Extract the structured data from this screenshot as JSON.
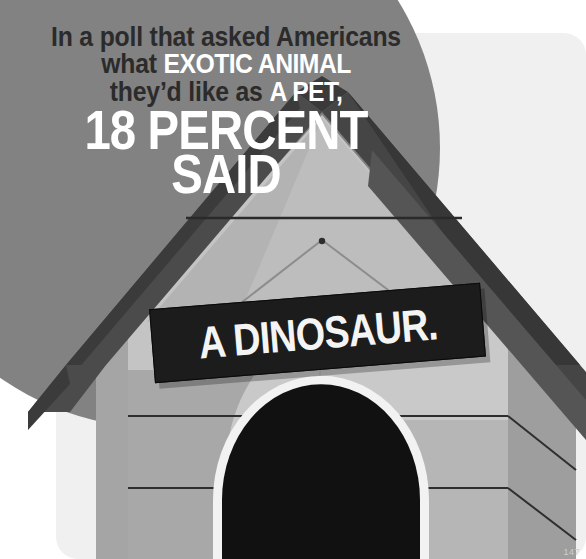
{
  "poster": {
    "headline": {
      "line1": "In a poll that asked Americans",
      "line2_plain": "what ",
      "line2_emphasis": "EXOTIC ANIMAL",
      "line3_plain": "they’d like as ",
      "line3_emphasis": "A PET,",
      "big_line1": "18 PERCENT",
      "big_line2": "SAID"
    },
    "sign": {
      "text": "A DINOSAUR."
    },
    "page_number": "147",
    "colors": {
      "circle_gray": "#828282",
      "light_panel": "#f0f0f0",
      "page_background": "#ffffff",
      "headline_dark_text": "#2b2b2b",
      "headline_light_text": "#ffffff",
      "sign_background": "#1c1c1c",
      "sign_text": "#f4f4f4",
      "roof_dark": "#4a4a4a",
      "roof_edge": "#3a3a3a",
      "wall_light": "#c9c9c9",
      "wall_mid": "#b0b0b0",
      "wall_shadow": "#9a9a9a",
      "door_black": "#111111",
      "door_outline": "#f2f2f2"
    },
    "illustration": {
      "subject": "dog-house",
      "elements": [
        "roof-peak",
        "roof-left-eave",
        "roof-right-eave",
        "front-wall-siding",
        "arched-doorway",
        "hanging-sign"
      ]
    }
  }
}
